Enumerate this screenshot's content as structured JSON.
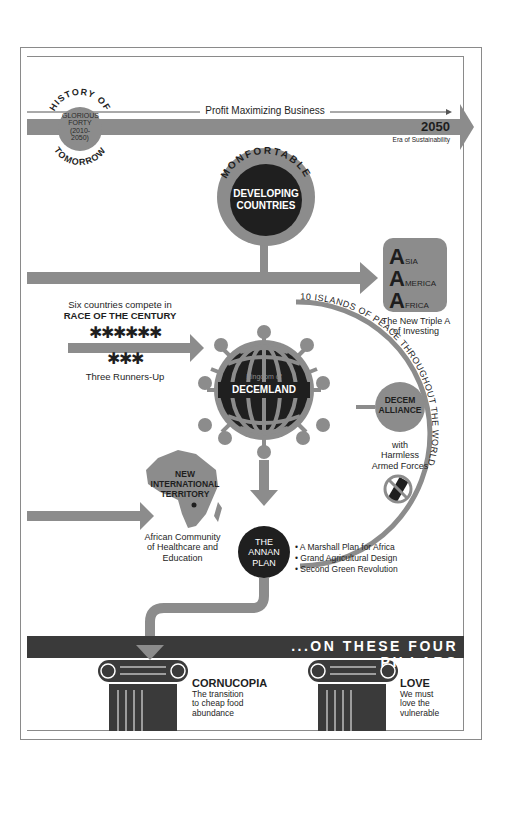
{
  "colors": {
    "gray": "#8c8c8c",
    "dark": "#1f1f1f",
    "light": "#ffffff",
    "line": "#555555"
  },
  "timeline": {
    "badge_top": "HISTORY OF",
    "badge_bottom": "TOMORROW",
    "badge_center": [
      "GLORIOUS",
      "FORTY",
      "(2010-",
      "2050)"
    ],
    "arrow_label": "Profit Maximizing Business",
    "end_year": "2050",
    "end_caption": "Era of Sustainability"
  },
  "developing": {
    "arc_text": "MONFORTABLE",
    "title_line1": "DEVELOPING",
    "title_line2": "COUNTRIES"
  },
  "triple_a": {
    "rows": [
      {
        "big": "A",
        "rest": "SIA"
      },
      {
        "big": "A",
        "rest": "MERICA"
      },
      {
        "big": "A",
        "rest": "FRICA"
      }
    ],
    "caption_line1": "The New Triple A",
    "caption_line2": "of Investing"
  },
  "race": {
    "line1": "Six countries compete in",
    "line2": "RACE OF THE CENTURY",
    "runners_top": "✱✱✱✱✱✱",
    "runners_bottom": "✱✱✱",
    "caption": "Three Runners-Up"
  },
  "decemland": {
    "kingdom": "Kingdom of",
    "name": "DECEMLAND",
    "arc_text": "10 ISLANDS OF PEACE THROUGHOUT THE WORLD"
  },
  "alliance": {
    "line1": "DECEM",
    "line2": "ALLIANCE",
    "caption_line1": "with",
    "caption_line2": "Harmless",
    "caption_line3": "Armed Forces"
  },
  "africa": {
    "title_line1": "NEW",
    "title_line2": "INTERNATIONAL",
    "title_line3": "TERRITORY",
    "caption_line1": "African Community",
    "caption_line2": "of Healthcare and",
    "caption_line3": "Education"
  },
  "annan": {
    "line1": "THE",
    "line2": "ANNAN",
    "line3": "PLAN",
    "bullets": [
      "• A Marshall Plan for Africa",
      "• Grand Agricultural Design",
      "• Second Green Revolution"
    ]
  },
  "pillars": {
    "banner": "...ON THESE FOUR PILLARS",
    "items": [
      {
        "title": "CORNUCOPIA",
        "line1": "The transition",
        "line2": "to cheap food",
        "line3": "abundance"
      },
      {
        "title": "LOVE",
        "line1": "We must",
        "line2": "love the",
        "line3": "vulnerable"
      }
    ]
  }
}
